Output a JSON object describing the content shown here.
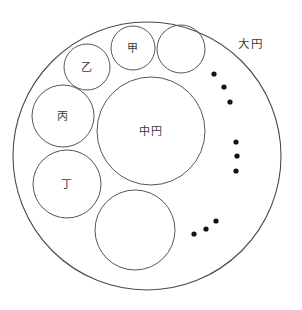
{
  "diagram": {
    "canvas": {
      "width": 302,
      "height": 310
    },
    "background_color": "#ffffff",
    "stroke_color": "#555555",
    "dot_color": "#111111",
    "label_color": "#3a3a3a",
    "outer_circle": {
      "name": "大円",
      "label": "大円",
      "label_reading": "daien",
      "cx": 147,
      "cy": 156,
      "r": 134,
      "label_x": 238,
      "label_y": 44
    },
    "inner_circles": [
      {
        "key": "middle",
        "label": "中円",
        "label_reading": "chuen",
        "cx": 151,
        "cy": 131,
        "r": 54,
        "has_label": true
      },
      {
        "key": "kou",
        "label": "甲",
        "label_reading": "kou",
        "cx": 133,
        "cy": 48,
        "r": 22,
        "has_label": true
      },
      {
        "key": "otsu",
        "label": "乙",
        "label_reading": "otsu",
        "cx": 87,
        "cy": 67,
        "r": 23,
        "has_label": true
      },
      {
        "key": "hei",
        "label": "丙",
        "label_reading": "hei",
        "cx": 63,
        "cy": 116,
        "r": 31,
        "has_label": true
      },
      {
        "key": "tei",
        "label": "丁",
        "label_reading": "tei",
        "cx": 67,
        "cy": 184,
        "r": 34,
        "has_label": true
      },
      {
        "key": "unlabeled-top-right",
        "label": "",
        "cx": 181,
        "cy": 49,
        "r": 24,
        "has_label": false
      },
      {
        "key": "unlabeled-bottom",
        "label": "",
        "cx": 135,
        "cy": 230,
        "r": 40,
        "has_label": false
      }
    ],
    "ellipsis_groups": [
      {
        "key": "upper-right-ellipsis",
        "dots": [
          {
            "cx": 214,
            "cy": 74,
            "r": 2.6
          },
          {
            "cx": 224,
            "cy": 87,
            "r": 2.6
          },
          {
            "cx": 230,
            "cy": 102,
            "r": 2.6
          }
        ]
      },
      {
        "key": "right-ellipsis",
        "dots": [
          {
            "cx": 236,
            "cy": 142,
            "r": 2.6
          },
          {
            "cx": 237,
            "cy": 156,
            "r": 2.6
          },
          {
            "cx": 236,
            "cy": 171,
            "r": 2.6
          }
        ]
      },
      {
        "key": "lower-right-ellipsis",
        "dots": [
          {
            "cx": 194,
            "cy": 234,
            "r": 2.6
          },
          {
            "cx": 206,
            "cy": 229,
            "r": 2.6
          },
          {
            "cx": 216,
            "cy": 221,
            "r": 2.6
          }
        ]
      }
    ]
  }
}
